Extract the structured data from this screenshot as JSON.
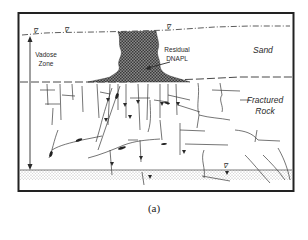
{
  "figure": {
    "caption": "(a)",
    "colors": {
      "ink": "#2a2a2a",
      "border": "#222222",
      "dnapl_fill": "#5a5a5a",
      "sediment_dots": "#9a9a9a",
      "background": "#ffffff"
    }
  },
  "labels": {
    "vadose_zone_line1": "Vadose",
    "vadose_zone_line2": "Zone",
    "residual_dnapl_line1": "Residual",
    "residual_dnapl_line2": "DNAPL",
    "sand": "Sand",
    "fractured_rock_line1": "Fractured",
    "fractured_rock_line2": "Rock",
    "water_table_symbol_1": "∇",
    "water_table_symbol_2": "∇",
    "water_table_symbol_3": "∇",
    "water_table_symbol_bottom": "∇"
  },
  "layers": [
    {
      "name": "Sand",
      "type": "unconsolidated"
    },
    {
      "name": "Fractured Rock",
      "type": "bedrock"
    },
    {
      "name": "Sediment",
      "type": "dotted base layer"
    }
  ]
}
